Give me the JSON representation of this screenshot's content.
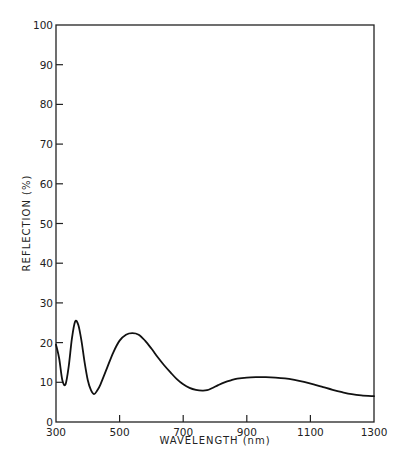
{
  "chart_data": {
    "type": "line",
    "title": "",
    "xlabel": "WAVELENGTH (nm)",
    "ylabel": "REFLECTION (%)",
    "xlim": [
      300,
      1300
    ],
    "ylim": [
      0,
      100
    ],
    "xticks": [
      300,
      500,
      700,
      900,
      1100,
      1300
    ],
    "yticks": [
      0,
      10,
      20,
      30,
      40,
      50,
      60,
      70,
      80,
      90,
      100
    ],
    "grid": false,
    "legend": null,
    "series": [
      {
        "name": "reflection",
        "x": [
          300,
          310,
          320,
          330,
          340,
          350,
          360,
          370,
          380,
          390,
          400,
          410,
          420,
          430,
          440,
          460,
          480,
          500,
          520,
          540,
          560,
          580,
          600,
          620,
          640,
          660,
          680,
          700,
          720,
          740,
          760,
          775,
          790,
          810,
          830,
          850,
          870,
          900,
          930,
          960,
          990,
          1020,
          1050,
          1080,
          1110,
          1140,
          1170,
          1200,
          1230,
          1260,
          1300
        ],
        "values": [
          19.5,
          16,
          10.5,
          9.5,
          14,
          21,
          25.3,
          24.5,
          20.5,
          15,
          10.5,
          8,
          7,
          8,
          9.5,
          13.5,
          17.5,
          20.5,
          22,
          22.4,
          22,
          20.5,
          18.5,
          16.3,
          14.3,
          12.5,
          10.8,
          9.5,
          8.6,
          8.1,
          7.9,
          8,
          8.5,
          9.3,
          10,
          10.5,
          10.9,
          11.2,
          11.3,
          11.3,
          11.2,
          11,
          10.6,
          10.1,
          9.5,
          8.8,
          8.1,
          7.5,
          7,
          6.7,
          6.5
        ]
      }
    ]
  },
  "axes": {
    "x_tick_labels": [
      "300",
      "500",
      "700",
      "900",
      "1100",
      "1300"
    ],
    "y_tick_labels": [
      "0",
      "10",
      "20",
      "30",
      "40",
      "50",
      "60",
      "70",
      "80",
      "90",
      "100"
    ],
    "xlabel": "WAVELENGTH (nm)",
    "ylabel": "REFLECTION (%)"
  }
}
